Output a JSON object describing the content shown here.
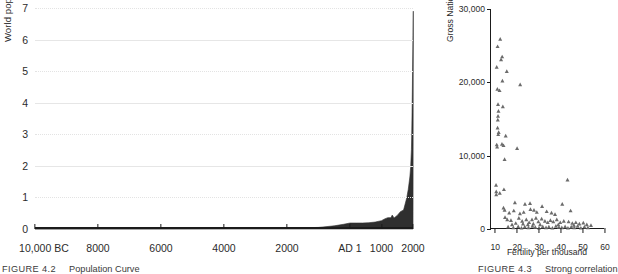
{
  "figures": {
    "left": {
      "caption_id": "FIGURE 4.2",
      "caption_text": "Population Curve",
      "ylabel": "World population, billions",
      "xlabel": ""
    },
    "right": {
      "caption_id": "FIGURE 4.3",
      "caption_text": "Strong correlation",
      "ylabel": "Gross National Product per capita",
      "xlabel": "Fertility per thousand"
    }
  },
  "chart_data": [
    {
      "type": "area",
      "title": "Population Curve",
      "xlabel": "",
      "ylabel": "World population, billions",
      "xtick_labels": [
        "10,000 BC",
        "8000",
        "6000",
        "4000",
        "2000",
        "AD 1",
        "1000",
        "2000"
      ],
      "xtick_values": [
        -10000,
        -8000,
        -6000,
        -4000,
        -2000,
        1,
        1000,
        2000
      ],
      "ytick_labels": [
        "0",
        "1",
        "2",
        "3",
        "4",
        "5",
        "6",
        "7"
      ],
      "ylim": [
        0,
        7
      ],
      "xlim": [
        -10000,
        2000
      ],
      "grid": "horizontal (alternating solid / dotted)",
      "series_name": "World population",
      "fill_color": "#2f2f2f",
      "x": [
        -10000,
        -9000,
        -8000,
        -7000,
        -6000,
        -5000,
        -4000,
        -3000,
        -2000,
        -1500,
        -1000,
        -500,
        -200,
        1,
        200,
        400,
        600,
        800,
        1000,
        1100,
        1200,
        1300,
        1340,
        1400,
        1500,
        1600,
        1700,
        1750,
        1800,
        1850,
        1900,
        1925,
        1950,
        1960,
        1970,
        1980,
        1990,
        2000,
        2010
      ],
      "y": [
        0.004,
        0.004,
        0.005,
        0.005,
        0.007,
        0.01,
        0.014,
        0.02,
        0.027,
        0.038,
        0.05,
        0.1,
        0.15,
        0.19,
        0.19,
        0.19,
        0.2,
        0.22,
        0.265,
        0.32,
        0.36,
        0.36,
        0.44,
        0.35,
        0.43,
        0.55,
        0.6,
        0.79,
        0.98,
        1.26,
        1.65,
        1.95,
        2.52,
        3.02,
        3.7,
        4.44,
        5.32,
        6.12,
        6.9
      ]
    },
    {
      "type": "scatter",
      "title": "Strong correlation",
      "xlabel": "Fertility per thousand",
      "ylabel": "Gross National Product per capita",
      "xtick_labels": [
        "10",
        "20",
        "30",
        "40",
        "50",
        "60"
      ],
      "xtick_values": [
        10,
        20,
        30,
        40,
        50,
        60
      ],
      "ytick_labels": [
        "0",
        "10,000",
        "20,000",
        "30,000"
      ],
      "ytick_values": [
        0,
        10000,
        20000,
        30000
      ],
      "xlim": [
        8,
        60
      ],
      "ylim": [
        0,
        30000
      ],
      "grid": "none",
      "marker": "triangle",
      "marker_color": "#6b6b6b",
      "points": [
        [
          11.0,
          24900
        ],
        [
          12.2,
          25900
        ],
        [
          10.6,
          22100
        ],
        [
          12.6,
          23100
        ],
        [
          13.1,
          23500
        ],
        [
          15.2,
          21500
        ],
        [
          13.2,
          20200
        ],
        [
          10.9,
          19100
        ],
        [
          11.9,
          18900
        ],
        [
          21.3,
          19700
        ],
        [
          11.2,
          17000
        ],
        [
          13.4,
          16700
        ],
        [
          11.4,
          16100
        ],
        [
          11.2,
          15400
        ],
        [
          11.1,
          14900
        ],
        [
          14.7,
          12700
        ],
        [
          10.6,
          11500
        ],
        [
          10.8,
          11200
        ],
        [
          13.0,
          11600
        ],
        [
          13.7,
          11400
        ],
        [
          19.9,
          11000
        ],
        [
          14.2,
          9500
        ],
        [
          10.3,
          6000
        ],
        [
          10.4,
          5100
        ],
        [
          10.4,
          4700
        ],
        [
          13.9,
          5400
        ],
        [
          42.9,
          6700
        ],
        [
          18.9,
          3600
        ],
        [
          23.5,
          3400
        ],
        [
          25.8,
          3500
        ],
        [
          31.3,
          3100
        ],
        [
          40.5,
          3400
        ],
        [
          13.7,
          2900
        ],
        [
          14.2,
          2600
        ],
        [
          16.3,
          2200
        ],
        [
          18.4,
          2500
        ],
        [
          21.2,
          2100
        ],
        [
          22.9,
          2300
        ],
        [
          26.0,
          2700
        ],
        [
          27.6,
          2600
        ],
        [
          28.9,
          2300
        ],
        [
          33.4,
          2400
        ],
        [
          35.6,
          2200
        ],
        [
          37.2,
          2000
        ],
        [
          44.3,
          2500
        ],
        [
          14.4,
          1600
        ],
        [
          15.4,
          1300
        ],
        [
          17.1,
          1200
        ],
        [
          20.7,
          1500
        ],
        [
          22.2,
          1100
        ],
        [
          24.1,
          1300
        ],
        [
          25.4,
          900
        ],
        [
          26.7,
          1300
        ],
        [
          28.5,
          1500
        ],
        [
          29.6,
          1000
        ],
        [
          31.1,
          1400
        ],
        [
          32.6,
          1100
        ],
        [
          33.9,
          900
        ],
        [
          35.1,
          1200
        ],
        [
          36.4,
          1000
        ],
        [
          38.0,
          1300
        ],
        [
          39.6,
          900
        ],
        [
          41.2,
          1100
        ],
        [
          43.4,
          1000
        ],
        [
          45.1,
          800
        ],
        [
          46.7,
          900
        ],
        [
          48.3,
          700
        ],
        [
          50.1,
          850
        ],
        [
          51.7,
          600
        ],
        [
          53.6,
          500
        ],
        [
          15.8,
          300
        ],
        [
          18.2,
          200
        ],
        [
          20.4,
          350
        ],
        [
          21.9,
          150
        ],
        [
          23.4,
          300
        ],
        [
          25.1,
          200
        ],
        [
          26.9,
          400
        ],
        [
          28.2,
          250
        ],
        [
          29.9,
          150
        ],
        [
          31.6,
          350
        ],
        [
          33.1,
          200
        ],
        [
          34.4,
          300
        ],
        [
          36.0,
          150
        ],
        [
          37.6,
          400
        ],
        [
          39.0,
          250
        ],
        [
          40.3,
          200
        ],
        [
          41.8,
          350
        ],
        [
          43.1,
          150
        ],
        [
          44.6,
          300
        ],
        [
          46.0,
          200
        ],
        [
          47.5,
          400
        ],
        [
          49.0,
          150
        ],
        [
          50.6,
          300
        ],
        [
          52.2,
          200
        ],
        [
          11.5,
          13200
        ],
        [
          11.0,
          13800
        ],
        [
          11.3,
          12900
        ],
        [
          12.0,
          4900
        ],
        [
          22.6,
          700
        ],
        [
          30.4,
          600
        ],
        [
          17.6,
          600
        ],
        [
          19.3,
          800
        ],
        [
          24.8,
          600
        ],
        [
          27.3,
          700
        ],
        [
          38.7,
          600
        ],
        [
          45.8,
          550
        ]
      ]
    }
  ]
}
